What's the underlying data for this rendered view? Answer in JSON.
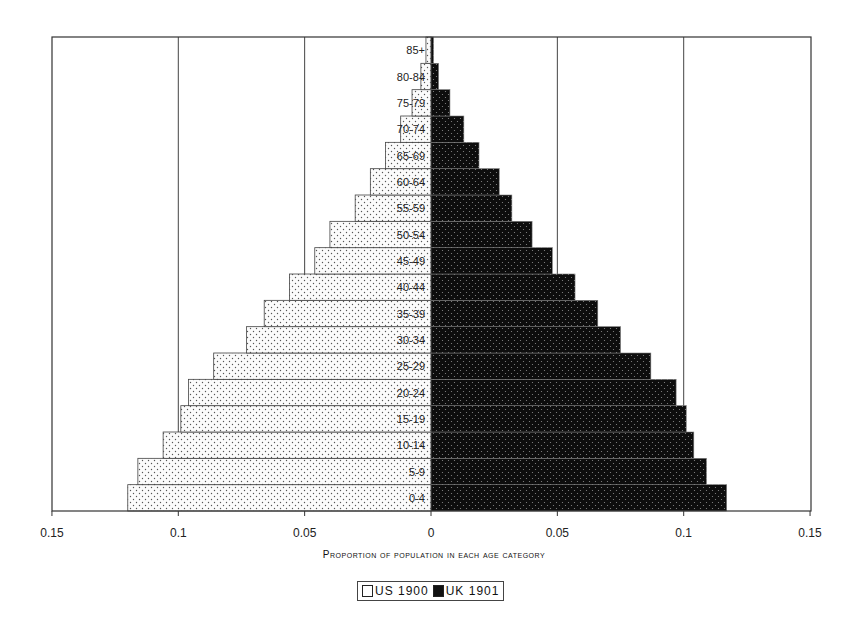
{
  "chart_data": {
    "type": "bar",
    "orientation": "horizontal",
    "subtype": "population-pyramid",
    "title": "",
    "xlabel": "Proportion of population in each age category",
    "ylabel": "",
    "xlim": [
      -0.15,
      0.15
    ],
    "x_ticks": [
      "0.15",
      "0.1",
      "0.05",
      "0",
      "0.05",
      "0.1",
      "0.15"
    ],
    "grid": "vertical lines at 0.05 intervals",
    "legend_position": "bottom-center",
    "categories": [
      "0-4",
      "5-9",
      "10-14",
      "15-19",
      "20-24",
      "25-29",
      "30-34",
      "35-39",
      "40-44",
      "45-49",
      "50-54",
      "55-59",
      "60-64",
      "65-69",
      "70-74",
      "75-79",
      "80-84",
      "85+"
    ],
    "series": [
      {
        "name": "US 1900",
        "side": "left",
        "fill": "dotted-white",
        "values": [
          0.12,
          0.116,
          0.106,
          0.099,
          0.096,
          0.086,
          0.073,
          0.066,
          0.056,
          0.046,
          0.04,
          0.03,
          0.024,
          0.018,
          0.012,
          0.0075,
          0.004,
          0.002
        ]
      },
      {
        "name": "UK 1901",
        "side": "right",
        "fill": "dotted-black",
        "values": [
          0.117,
          0.109,
          0.104,
          0.101,
          0.097,
          0.087,
          0.075,
          0.066,
          0.057,
          0.048,
          0.04,
          0.032,
          0.027,
          0.019,
          0.013,
          0.0075,
          0.003,
          0.001
        ]
      }
    ]
  },
  "axis": {
    "xlabel": "Proportion of population in each age category"
  },
  "legend": {
    "us_label": "US 1900",
    "uk_label": "UK 1901"
  },
  "colors": {
    "us_fill": "#ffffff",
    "uk_fill": "#111111",
    "frame": "#333333"
  }
}
